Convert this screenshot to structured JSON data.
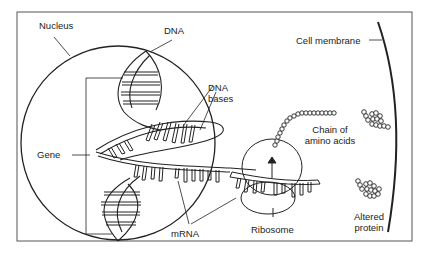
{
  "diagram": {
    "type": "biology-illustration",
    "labels": {
      "nucleus": "Nucleus",
      "dna": "DNA",
      "dna_bases_line1": "DNA",
      "dna_bases_line2": "bases",
      "gene": "Gene",
      "mrna": "mRNA",
      "ribosome": "Ribosome",
      "chain_line1": "Chain of",
      "chain_line2": "amino acids",
      "cell_membrane": "Cell membrane",
      "altered_line1": "Altered",
      "altered_line2": "protein"
    },
    "colors": {
      "line": "#222222",
      "frame": "#555555",
      "background": "#ffffff"
    }
  }
}
